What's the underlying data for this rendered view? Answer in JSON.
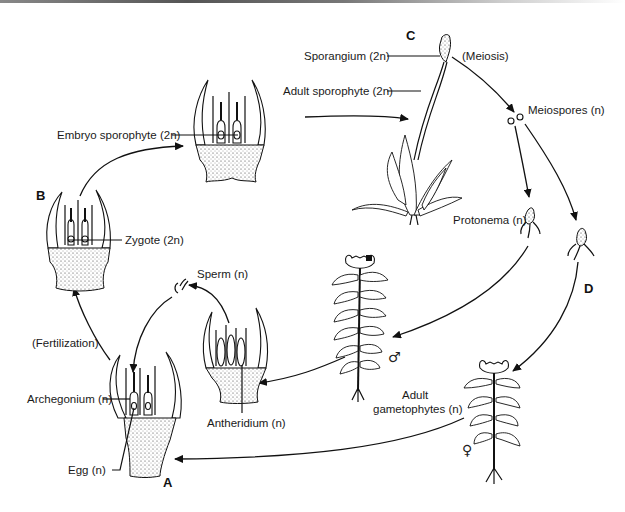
{
  "stage_letters": {
    "a": "A",
    "b": "B",
    "c": "C",
    "d": "D"
  },
  "labels": {
    "sporangium": "Sporangium (2n)",
    "adult_sporophyte": "Adult sporophyte (2n)",
    "meiosis": "(Meiosis)",
    "meiospores": "Meiospores (n)",
    "protonema": "Protonema (n)",
    "embryo_sporophyte": "Embryo sporophyte (2n)",
    "zygote": "Zygote (2n)",
    "sperm": "Sperm (n)",
    "fertilization": "(Fertilization)",
    "archegonium": "Archegonium (n)",
    "egg": "Egg (n)",
    "antheridium": "Antheridium (n)",
    "adult_gametophytes_line1": "Adult",
    "adult_gametophytes_line2": "gametophytes (n)"
  },
  "symbols": {
    "male": "♂",
    "female": "♀"
  },
  "colors": {
    "ink": "#111111",
    "background": "#ffffff"
  }
}
